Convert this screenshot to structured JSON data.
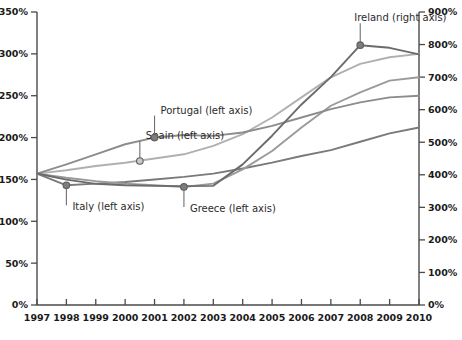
{
  "chart_data": {
    "type": "line",
    "title": "",
    "subtitle": "",
    "xlabel": "",
    "ylabel": "",
    "grid": false,
    "legend_position": "inline-callouts",
    "x": [
      1997,
      1998,
      1999,
      2000,
      2001,
      2002,
      2003,
      2004,
      2005,
      2006,
      2007,
      2008,
      2009,
      2010
    ],
    "x_tick_labels": [
      "1997",
      "1998",
      "1999",
      "2000",
      "2001",
      "2002",
      "2003",
      "2004",
      "2005",
      "2006",
      "2007",
      "2008",
      "2009",
      "2010"
    ],
    "left_axis": {
      "label": "",
      "ylim": [
        0,
        350
      ],
      "tick_values": [
        0,
        50,
        100,
        150,
        200,
        250,
        300,
        350
      ],
      "tick_labels": [
        "0%",
        "50%",
        "100%",
        "150%",
        "200%",
        "250%",
        "300%",
        "350%"
      ]
    },
    "right_axis": {
      "label": "",
      "ylim": [
        0,
        900
      ],
      "tick_values": [
        0,
        100,
        200,
        300,
        400,
        500,
        600,
        700,
        800,
        900
      ],
      "tick_labels": [
        "0%",
        "100%",
        "200%",
        "300%",
        "400%",
        "500%",
        "600%",
        "700%",
        "800%",
        "900%"
      ]
    },
    "series": [
      {
        "name": "Italy",
        "axis": "left",
        "label": "Italy (left axis)",
        "color": "#7a7a7a",
        "values": [
          157,
          143,
          145,
          147,
          150,
          153,
          157,
          163,
          170,
          178,
          185,
          195,
          205,
          212
        ]
      },
      {
        "name": "Greece",
        "axis": "left",
        "label": "Greece (left axis)",
        "color": "#9a9a9a",
        "values": [
          157,
          152,
          148,
          145,
          143,
          141,
          145,
          162,
          184,
          212,
          238,
          254,
          268,
          272
        ]
      },
      {
        "name": "Spain",
        "axis": "left",
        "label": "Spain (left axis)",
        "color": "#b0b0b0",
        "values": [
          157,
          161,
          166,
          170,
          175,
          180,
          190,
          204,
          224,
          248,
          272,
          288,
          296,
          300
        ]
      },
      {
        "name": "Portugal",
        "axis": "left",
        "label": "Portugal (left axis)",
        "color": "#8c8c8c",
        "values": [
          157,
          168,
          180,
          192,
          200,
          203,
          202,
          206,
          214,
          224,
          234,
          242,
          248,
          250
        ]
      },
      {
        "name": "Ireland",
        "axis": "right",
        "label": "Ireland (right axis)",
        "color": "#6b6b6b",
        "values": [
          404,
          385,
          372,
          368,
          366,
          365,
          366,
          432,
          520,
          616,
          700,
          798,
          790,
          770
        ]
      }
    ],
    "annotations": [
      {
        "series": "Italy",
        "label": "Italy (left axis)",
        "at_x": 1998,
        "at_value": 143
      },
      {
        "series": "Greece",
        "label": "Greece (left axis)",
        "at_x": 2002,
        "at_value": 141
      },
      {
        "series": "Spain",
        "label": "Spain (left axis)",
        "at_x": 2000.5,
        "at_value": 172
      },
      {
        "series": "Portugal",
        "label": "Portugal (left axis)",
        "at_x": 2001,
        "at_value": 200
      },
      {
        "series": "Ireland",
        "label": "Ireland (right axis)",
        "at_x": 2008,
        "at_value": 798
      }
    ]
  },
  "colors": {
    "axis": "#4a4a4a",
    "text": "#1a1a1a",
    "callout": "#6f6f6f",
    "background": "#ffffff"
  }
}
